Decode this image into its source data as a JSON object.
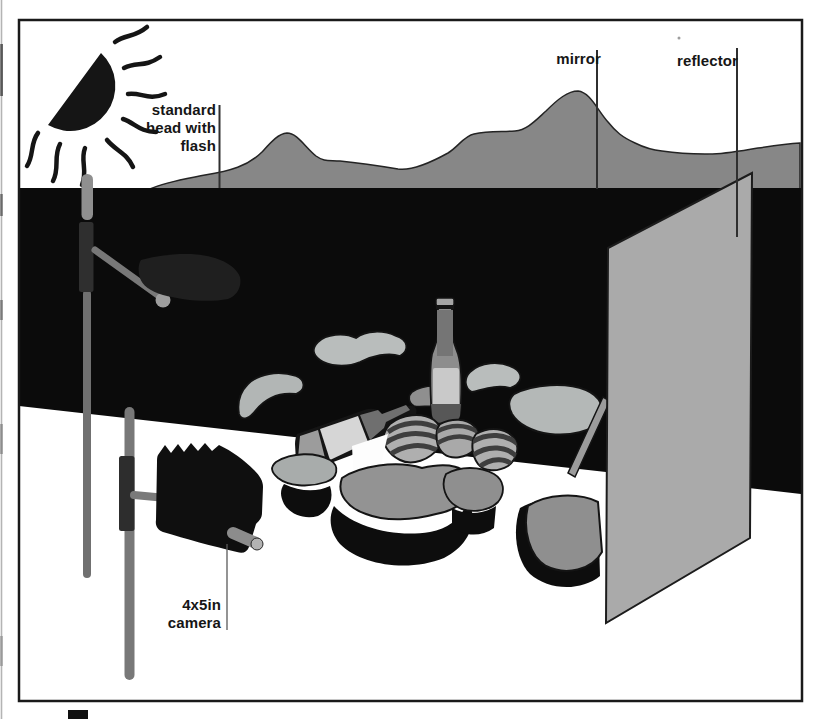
{
  "figure": {
    "name": "studio-lighting-setup-diagram",
    "labels": {
      "flash_head": "standard\nhead with\nflash",
      "mirror": "mirror",
      "reflector": "reflector",
      "camera": "4x5in\ncamera"
    },
    "colors": {
      "page_background": "#ffffff",
      "ink_black": "#141414",
      "backdrop_black": "#0b0b0b",
      "mountain_gray": "#878787",
      "reflector_gray": "#aaaaaa",
      "rock_light_gray": "#b9bdbc",
      "rock_mid_gray": "#929292",
      "bottle_label_gray": "#c9c9c9",
      "stand_gray": "#787878"
    },
    "scene_objects": [
      "sun-symbol",
      "mountain-backdrop",
      "black-backdrop",
      "flash-stand",
      "standard-flash-head",
      "camera-stand",
      "view-camera",
      "rock-still-life",
      "standing-bottle",
      "lying-bottle",
      "striped-shells",
      "mirror-stick",
      "reflector-panel"
    ]
  }
}
